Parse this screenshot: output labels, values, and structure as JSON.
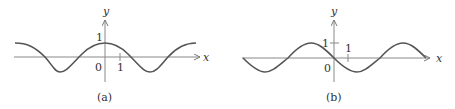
{
  "panels": [
    {
      "id": "a",
      "caption": "(a)",
      "x_axis_label": "x",
      "y_axis_label": "y",
      "origin_label": "0",
      "x_tick_label": "1",
      "y_tick_label": "1",
      "function": "cos-like: max 1 at x=0"
    },
    {
      "id": "b",
      "caption": "(b)",
      "x_axis_label": "x",
      "y_axis_label": "y",
      "origin_label": "0",
      "x_tick_label": "1",
      "y_tick_label": "1",
      "function": "negative sine-like: 0 at x=0, decreasing"
    }
  ],
  "colors": {
    "curve": "#555555",
    "axis": "#777777",
    "text": "#333333"
  }
}
